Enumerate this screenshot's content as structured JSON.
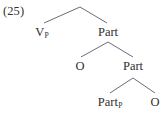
{
  "figure": {
    "example_number": "(25)",
    "line_color": "#5a5a6a",
    "text_color": "#2f2f2f",
    "background": "#ffffff"
  },
  "nodes": [
    {
      "id": "vp",
      "label": "V",
      "subscript": "P",
      "x": 42,
      "y": 26
    },
    {
      "id": "part1",
      "label": "Part",
      "subscript": "",
      "x": 108,
      "y": 26
    },
    {
      "id": "o1",
      "label": "O",
      "subscript": "",
      "x": 80,
      "y": 60
    },
    {
      "id": "part2",
      "label": "Part",
      "subscript": "",
      "x": 133,
      "y": 60
    },
    {
      "id": "partp",
      "label": "Part",
      "subscript": "P",
      "x": 110,
      "y": 96
    },
    {
      "id": "o2",
      "label": "O",
      "subscript": "",
      "x": 155,
      "y": 96
    }
  ],
  "branches": [
    {
      "id": "root-left",
      "x1": 80,
      "y1": 7,
      "x2": 44,
      "y2": 23
    },
    {
      "id": "root-right",
      "x1": 80,
      "y1": 7,
      "x2": 107,
      "y2": 23
    },
    {
      "id": "part1-left",
      "x1": 108,
      "y1": 42,
      "x2": 81,
      "y2": 57
    },
    {
      "id": "part1-right",
      "x1": 108,
      "y1": 42,
      "x2": 133,
      "y2": 57
    },
    {
      "id": "part2-left",
      "x1": 133,
      "y1": 78,
      "x2": 110,
      "y2": 93
    },
    {
      "id": "part2-right",
      "x1": 133,
      "y1": 78,
      "x2": 155,
      "y2": 93
    }
  ]
}
